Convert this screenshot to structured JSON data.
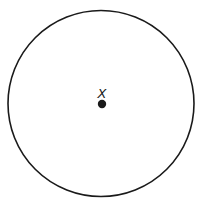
{
  "diagram": {
    "circle": {
      "cx": 101,
      "cy": 103.5,
      "r": 93,
      "stroke": "#1a1a1a",
      "stroke_width": 1.6
    },
    "center_point": {
      "cx": 102,
      "cy": 104,
      "r": 4.2,
      "fill": "#1a1a1a"
    },
    "center_label": {
      "text": "X",
      "x": 102,
      "y": 98
    }
  }
}
